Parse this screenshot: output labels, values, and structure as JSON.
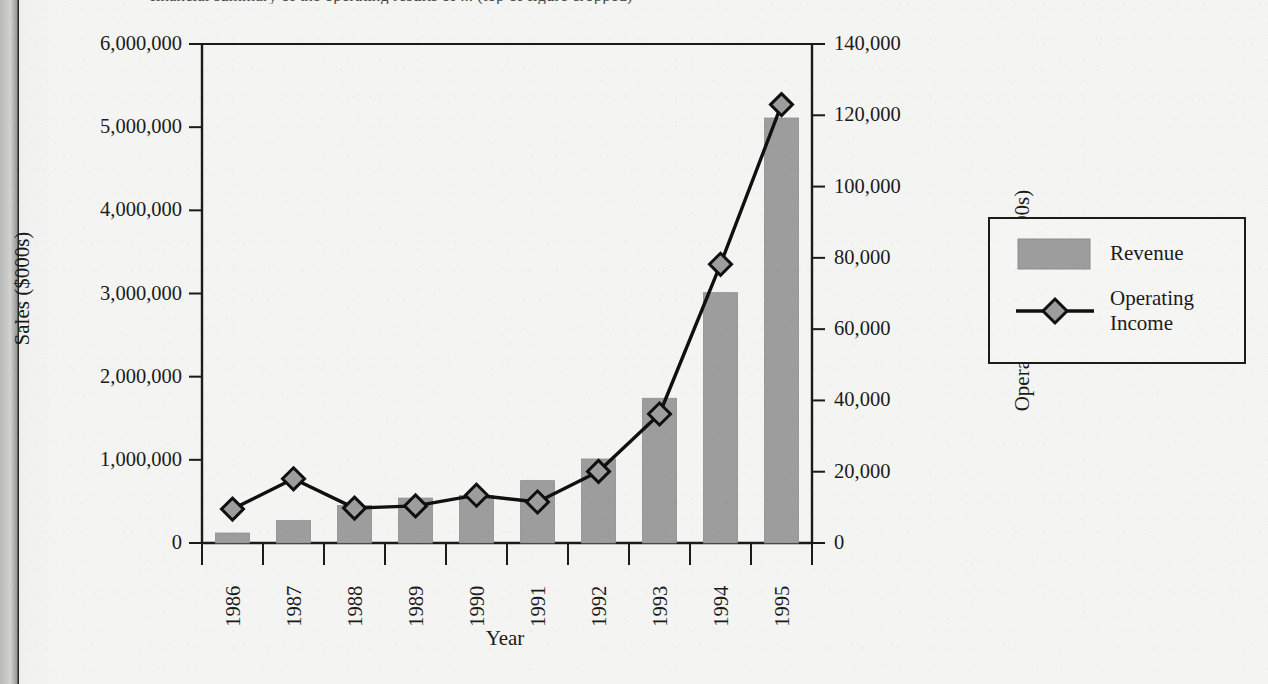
{
  "page": {
    "background_color": "#f2f2f0",
    "clipped_title": "financial summary of the operating results of ... (top of figure cropped)"
  },
  "chart_data": {
    "type": "bar",
    "title": "",
    "categories": [
      "1986",
      "1987",
      "1988",
      "1989",
      "1990",
      "1991",
      "1992",
      "1993",
      "1994",
      "1995"
    ],
    "xlabel": "Year",
    "ylabel": "Sales ($000s)",
    "y2label": "Operating Income ($000s)",
    "ylim": [
      0,
      6000000
    ],
    "y2lim": [
      0,
      140000
    ],
    "grid": false,
    "legend_position": "right",
    "series": [
      {
        "name": "Revenue",
        "kind": "bar",
        "axis": "left",
        "color": "#9d9d9d",
        "values": [
          120000,
          270000,
          450000,
          540000,
          570000,
          750000,
          1010000,
          1740000,
          3010000,
          5110000
        ]
      },
      {
        "name": "Operating Income",
        "kind": "line",
        "axis": "right",
        "color": "#101010",
        "marker": "diamond",
        "values": [
          9500,
          18000,
          9800,
          10400,
          13400,
          11500,
          20100,
          36200,
          78200,
          123000
        ]
      }
    ],
    "yticks": [
      "0",
      "1,000,000",
      "2,000,000",
      "3,000,000",
      "4,000,000",
      "5,000,000",
      "6,000,000"
    ],
    "ytick_values": [
      0,
      1000000,
      2000000,
      3000000,
      4000000,
      5000000,
      6000000
    ],
    "y2ticks": [
      "0",
      "20,000",
      "40,000",
      "60,000",
      "80,000",
      "100,000",
      "120,000",
      "140,000"
    ],
    "y2tick_values": [
      0,
      20000,
      40000,
      60000,
      80000,
      100000,
      120000,
      140000
    ]
  },
  "legend": {
    "items": [
      {
        "label": "Revenue",
        "type": "swatch",
        "color": "#9d9d9d"
      },
      {
        "label": "Operating\nIncome",
        "type": "line-marker",
        "color": "#101010"
      }
    ]
  }
}
